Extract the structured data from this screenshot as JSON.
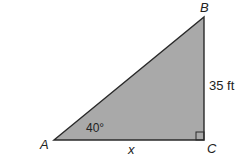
{
  "diagram": {
    "type": "right-triangle",
    "fill_color": "#a9a9a9",
    "stroke_color": "#2a2a2a",
    "vertices": {
      "A": {
        "label": "A"
      },
      "B": {
        "label": "B"
      },
      "C": {
        "label": "C"
      }
    },
    "angle_label": "40°",
    "side_bc_label": "35 ft",
    "side_ac_label": "x"
  }
}
